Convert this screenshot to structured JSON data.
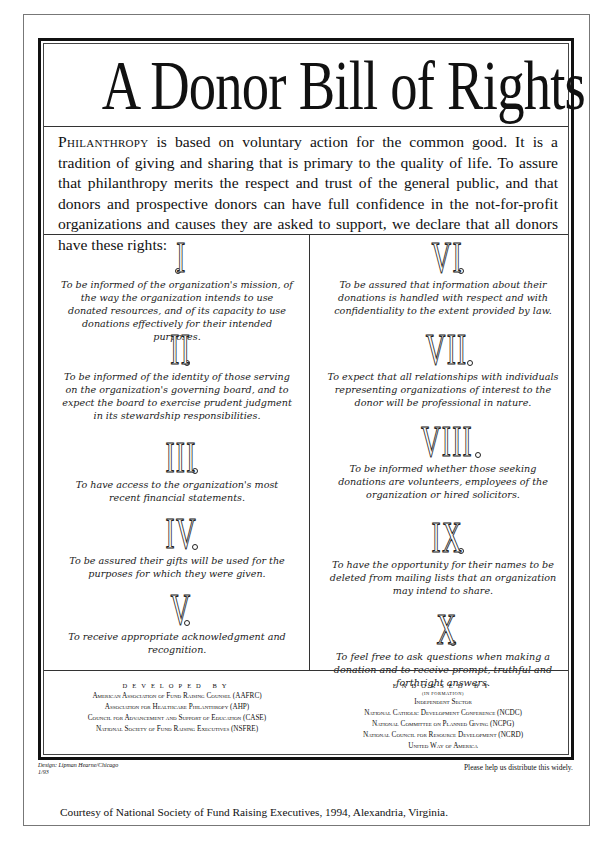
{
  "title": "A Donor Bill of Rights",
  "intro": {
    "lead": "Philanthropy",
    "text": " is based on voluntary action for the common good.  It is a tradition of giving and sharing that is primary to the quality of life. To assure that philanthropy merits the respect and trust of the general public, and that donors and prospective donors can have full confidence in the not-for-profit organizations and causes they are asked to support, we declare that all donors have these rights:"
  },
  "rights": {
    "left": [
      {
        "numeral": "I",
        "text": "To be informed of the organization's mission, of the way the organization intends to use donated resources, and of its capacity to use donations effectively for their intended purposes."
      },
      {
        "numeral": "II",
        "text": "To be informed of the identity of those serving on the organization's governing board, and to expect the board to exercise prudent judgment in its stewardship responsibilities."
      },
      {
        "numeral": "III",
        "text": "To have access to the organization's most recent financial statements."
      },
      {
        "numeral": "IV",
        "text": "To be assured their gifts will be used for the purposes for which they were given."
      },
      {
        "numeral": "V",
        "text": "To receive appropriate acknowledgment and recognition."
      }
    ],
    "right": [
      {
        "numeral": "VI",
        "text": "To be assured that information about their donations is handled with respect and with confidentiality to the extent provided by law."
      },
      {
        "numeral": "VII",
        "text": "To expect that all relationships with individuals representing organizations of interest to the donor will be professional in nature."
      },
      {
        "numeral": "VIII",
        "text": "To be informed whether those seeking donations are volunteers, employees of the organization or hired solicitors."
      },
      {
        "numeral": "IX",
        "text": "To have the opportunity for their names to be deleted from mailing lists that an organization may intend to share."
      },
      {
        "numeral": "X",
        "text": "To feel free to ask questions when making a donation and to receive prompt, truthful and forthright answers."
      }
    ]
  },
  "footer": {
    "developed": {
      "heading": "DEVELOPED BY",
      "orgs": [
        "American Association of Fund Raising Counsel (AAFRC)",
        "Association for Healthcare Philanthropy (AHP)",
        "Council for Advancement and Support of Education (CASE)",
        "National Society of Fund Raising Executives (NSFRE)"
      ]
    },
    "endorsed": {
      "heading": "ENDORSED BY",
      "subheading": "(IN FORMATION)",
      "orgs": [
        "Independent Sector",
        "National Catholic Development Conference (NCDC)",
        "National Committee on Planned Giving (NCPG)",
        "National Council for Resource Development (NCRD)",
        "United Way of America"
      ]
    }
  },
  "design_credit": {
    "line1": "Design: Lipman Hearne/Chicago",
    "line2": "1/93"
  },
  "distribute_note": "Please help us distribute this widely.",
  "courtesy": "Courtesy of National Society of Fund Raising Executives, 1994, Alexandria, Virginia."
}
